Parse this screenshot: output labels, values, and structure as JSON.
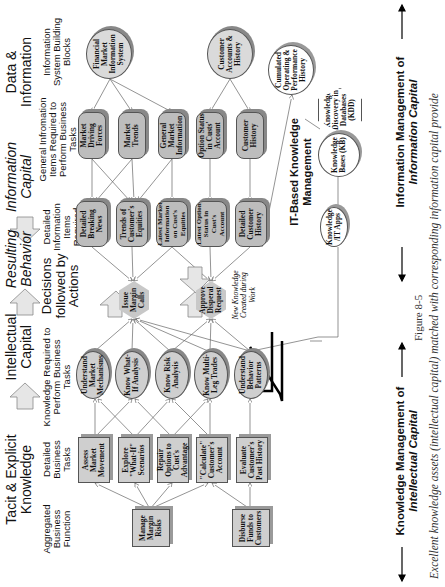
{
  "column_headers": {
    "tacit_explicit": "Tacit & Explicit Knowledge",
    "intellectual_capital": "Intellectual Capital",
    "resulting_behavior": "Resulting Behavior",
    "information_capital": "Information Capital",
    "data_information": "Data & Information"
  },
  "sub_headers": {
    "aggregated_function": "Aggregated Business Function",
    "detailed_tasks": "Detailed Business Tasks",
    "knowledge_required": "Knowledge Required to Perform Business Tasks",
    "decisions": "Decisions followed by Actions",
    "detailed_info": "Detailed Information Items Required",
    "general_info": "General Infromation Items Required to Perform Business Tasks",
    "info_system": "Information System Building Blocks"
  },
  "aggregated_functions": [
    "Manage Margin Risks",
    "Disburse Funds to Customers"
  ],
  "detailed_tasks": [
    "Assess Market Movement",
    "Explore \"What-If\" Scenarios",
    "Repair Options to Cust's Advantage",
    "\"Calculate\" Customer's Account",
    "Evaluate Customer's Past History"
  ],
  "knowledge_items": [
    "Understand Market Mechanisms",
    "Know What-If Analysis",
    "Know Risk Analysis",
    "Know Multi-Leg Trades",
    "Understand Behavior Patterns"
  ],
  "decisions": [
    "Issue Margin Calls",
    "Approve Disperal Request"
  ],
  "detailed_information": [
    "Detailed Breaking News",
    "Trends of Customer's Equities",
    "Latest Market Information on Cust's Equities",
    "Latest Option Status in Cust's Account",
    "Detailed Customer History"
  ],
  "general_information": [
    "Market Driving Forces",
    "Market Trends",
    "General Market Information",
    "Option Status in Custs' Account",
    "Customer History"
  ],
  "info_systems": [
    "Financial Market Information System",
    "Customer Accounts & History"
  ],
  "it_km": {
    "title": "IT-Based Knowledge Management",
    "cumulated": "Cumulated Operating & Performance History",
    "kdd": "Knowledge Discovery in Databases (KDD)",
    "kb": "Knowledge Bases (KB)",
    "apps": "Knowledge /IT Apps",
    "new_knowledge": "New Knowledge Created during Work"
  },
  "bottom_labels": {
    "km_intellectual_line1": "Knowledge Management of",
    "km_intellectual_line2": "Intellectual Capital",
    "im_information_line1": "Information Management of",
    "im_information_line2": "Information Capital"
  },
  "figure": {
    "number": "Figure 8-5",
    "caption": "Excellent knowledge assets (intellectual capital) matched with corresponding information capital provide"
  },
  "colors": {
    "node_fill": "#cfcfcf",
    "rounded_fill": "#bdbdbd",
    "line": "#555555",
    "feedback_line": "#000000"
  }
}
